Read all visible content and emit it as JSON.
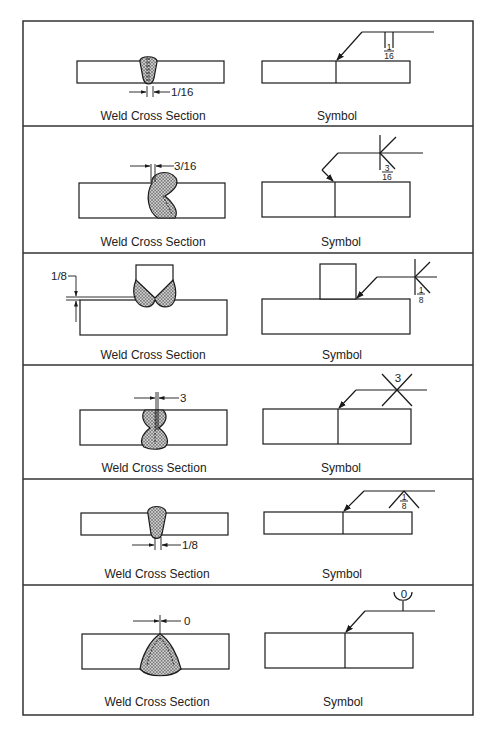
{
  "figure": {
    "frame": {
      "x": 23,
      "y": 21,
      "width": 450,
      "height": 694
    },
    "colors": {
      "line": "#1a1a1a",
      "text": "#222222",
      "background": "#ffffff",
      "hatch": "#555555"
    },
    "panels": [
      {
        "id": 1,
        "weld_type": "square-groove",
        "left_caption": "Weld Cross Section",
        "right_caption": "Symbol",
        "cross_section_dimension": "1/16",
        "symbol_num": "1",
        "symbol_den": "16"
      },
      {
        "id": 2,
        "weld_type": "double-bevel-groove",
        "left_caption": "Weld Cross Section",
        "right_caption": "Symbol",
        "cross_section_dimension": "3/16",
        "symbol_num": "3",
        "symbol_den": "16"
      },
      {
        "id": 3,
        "weld_type": "double-bevel-tee",
        "left_caption": "Weld Cross Section",
        "right_caption": "Symbol",
        "cross_section_dimension": "1/8",
        "symbol_num": "1",
        "symbol_den": "8"
      },
      {
        "id": 4,
        "weld_type": "double-v-groove",
        "left_caption": "Weld Cross Section",
        "right_caption": "Symbol",
        "cross_section_dimension": "3",
        "symbol_label": "3"
      },
      {
        "id": 5,
        "weld_type": "v-groove-other-side",
        "left_caption": "Weld Cross Section",
        "right_caption": "Symbol",
        "cross_section_dimension": "1/8",
        "symbol_num": "1",
        "symbol_den": "8"
      },
      {
        "id": 6,
        "weld_type": "u-groove",
        "left_caption": "Weld Cross Section",
        "right_caption": "Symbol",
        "cross_section_dimension": "0",
        "symbol_label": "0"
      }
    ]
  }
}
